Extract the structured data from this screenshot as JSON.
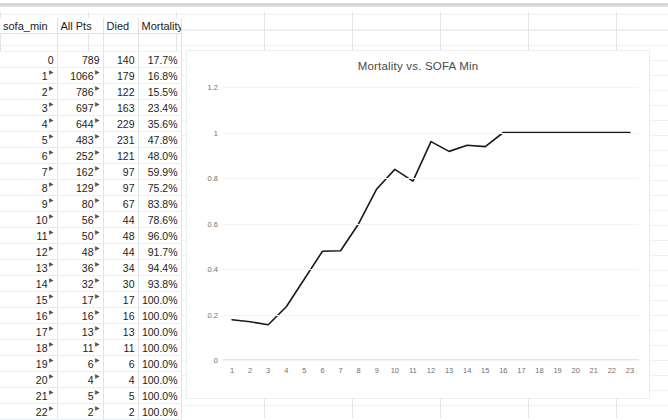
{
  "table": {
    "columns": [
      "sofa_min",
      "All Pts",
      "Died",
      "Mortality"
    ],
    "rows": [
      {
        "sofa_min": "0",
        "all_pts": "789",
        "died": "140",
        "mortality": "17.7%"
      },
      {
        "sofa_min": "1",
        "all_pts": "1066",
        "died": "179",
        "mortality": "16.8%"
      },
      {
        "sofa_min": "2",
        "all_pts": "786",
        "died": "122",
        "mortality": "15.5%"
      },
      {
        "sofa_min": "3",
        "all_pts": "697",
        "died": "163",
        "mortality": "23.4%"
      },
      {
        "sofa_min": "4",
        "all_pts": "644",
        "died": "229",
        "mortality": "35.6%"
      },
      {
        "sofa_min": "5",
        "all_pts": "483",
        "died": "231",
        "mortality": "47.8%"
      },
      {
        "sofa_min": "6",
        "all_pts": "252",
        "died": "121",
        "mortality": "48.0%"
      },
      {
        "sofa_min": "7",
        "all_pts": "162",
        "died": "97",
        "mortality": "59.9%"
      },
      {
        "sofa_min": "8",
        "all_pts": "129",
        "died": "97",
        "mortality": "75.2%"
      },
      {
        "sofa_min": "9",
        "all_pts": "80",
        "died": "67",
        "mortality": "83.8%"
      },
      {
        "sofa_min": "10",
        "all_pts": "56",
        "died": "44",
        "mortality": "78.6%"
      },
      {
        "sofa_min": "11",
        "all_pts": "50",
        "died": "48",
        "mortality": "96.0%"
      },
      {
        "sofa_min": "12",
        "all_pts": "48",
        "died": "44",
        "mortality": "91.7%"
      },
      {
        "sofa_min": "13",
        "all_pts": "36",
        "died": "34",
        "mortality": "94.4%"
      },
      {
        "sofa_min": "14",
        "all_pts": "32",
        "died": "30",
        "mortality": "93.8%"
      },
      {
        "sofa_min": "15",
        "all_pts": "17",
        "died": "17",
        "mortality": "100.0%"
      },
      {
        "sofa_min": "16",
        "all_pts": "16",
        "died": "16",
        "mortality": "100.0%"
      },
      {
        "sofa_min": "17",
        "all_pts": "13",
        "died": "13",
        "mortality": "100.0%"
      },
      {
        "sofa_min": "18",
        "all_pts": "11",
        "died": "11",
        "mortality": "100.0%"
      },
      {
        "sofa_min": "19",
        "all_pts": "6",
        "died": "6",
        "mortality": "100.0%"
      },
      {
        "sofa_min": "20",
        "all_pts": "4",
        "died": "4",
        "mortality": "100.0%"
      },
      {
        "sofa_min": "21",
        "all_pts": "5",
        "died": "5",
        "mortality": "100.0%"
      },
      {
        "sofa_min": "22",
        "all_pts": "2",
        "died": "2",
        "mortality": "100.0%"
      }
    ]
  },
  "chart_data": {
    "type": "line",
    "title": "Mortality vs. SOFA Min",
    "xlabel": "",
    "ylabel": "",
    "ylim": [
      0,
      1.2
    ],
    "yticks": [
      "0",
      "0.2",
      "0.4",
      "0.6",
      "0.8",
      "1",
      "1.2"
    ],
    "ytick_values": [
      0,
      0.2,
      0.4,
      0.6,
      0.8,
      1,
      1.2
    ],
    "grid": true,
    "legend": false,
    "categories": [
      "1",
      "2",
      "3",
      "4",
      "5",
      "6",
      "7",
      "8",
      "9",
      "10",
      "11",
      "12",
      "13",
      "14",
      "15",
      "16",
      "17",
      "18",
      "19",
      "20",
      "21",
      "22",
      "23"
    ],
    "series": [
      {
        "name": "Mortality",
        "color": "#1a1a1a",
        "values": [
          0.177,
          0.168,
          0.155,
          0.234,
          0.356,
          0.478,
          0.48,
          0.599,
          0.752,
          0.838,
          0.786,
          0.96,
          0.917,
          0.944,
          0.938,
          1.0,
          1.0,
          1.0,
          1.0,
          1.0,
          1.0,
          1.0,
          1.0
        ]
      }
    ]
  }
}
